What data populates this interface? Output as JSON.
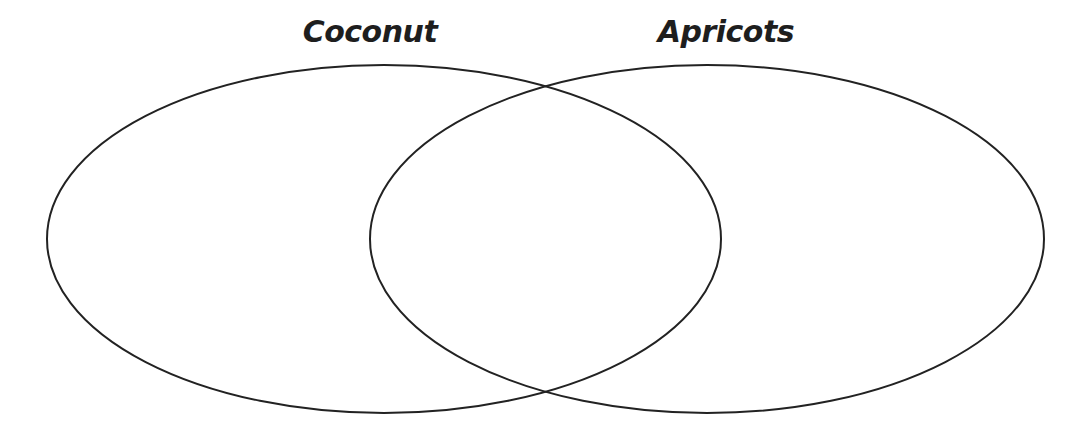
{
  "diagram": {
    "type": "venn",
    "sets": [
      {
        "label": "Coconut",
        "shape": {
          "cx": 384,
          "cy": 239,
          "rx": 337,
          "ry": 174
        }
      },
      {
        "label": "Apricots",
        "shape": {
          "cx": 707,
          "cy": 239,
          "rx": 337,
          "ry": 174
        }
      }
    ],
    "regions": {
      "coconut_only": "",
      "both": "",
      "apricots_only": ""
    },
    "stroke_color": "#222222",
    "background_color": "#ffffff"
  }
}
